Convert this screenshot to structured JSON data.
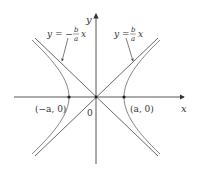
{
  "diagram": {
    "type": "hyperbola-with-asymptotes",
    "axes": {
      "x_label": "x",
      "y_label": "y",
      "origin_label": "0"
    },
    "vertices": [
      {
        "label": "(−a, 0)"
      },
      {
        "label": "(a, 0)"
      }
    ],
    "asymptotes": [
      {
        "label_lhs": "y = −",
        "frac_num": "b",
        "frac_den": "a",
        "var": "x"
      },
      {
        "label_lhs": "y =",
        "frac_num": "b",
        "frac_den": "a",
        "var": "x"
      }
    ],
    "colors": {
      "axis": "#444444",
      "curve": "#777777",
      "text": "#333333"
    }
  }
}
